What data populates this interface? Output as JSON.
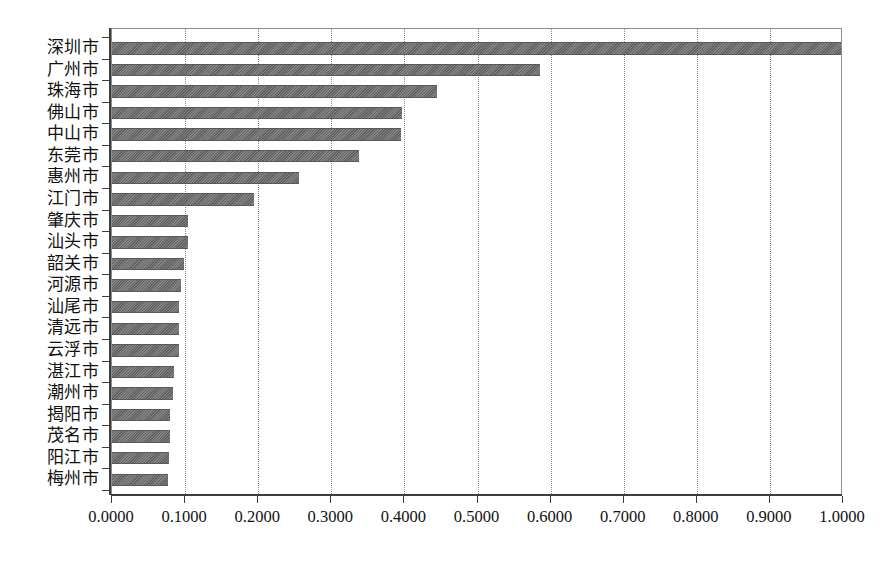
{
  "chart_data": {
    "type": "bar",
    "orientation": "horizontal",
    "title": "",
    "subtitle": "",
    "xlabel": "",
    "ylabel": "",
    "xlim": [
      0.0,
      1.0
    ],
    "grid": true,
    "legend": false,
    "legend_position": "none",
    "bar_color": "#6d6d6d",
    "axis_color": "#3d3d3d",
    "gridline_color": "#8a8a8a",
    "background_color": "#ffffff",
    "xticks": [
      0.0,
      0.1,
      0.2,
      0.3,
      0.4,
      0.5,
      0.6,
      0.7,
      0.8,
      0.9,
      1.0
    ],
    "xtick_labels": [
      "0.0000",
      "0.1000",
      "0.2000",
      "0.3000",
      "0.4000",
      "0.5000",
      "0.6000",
      "0.7000",
      "0.8000",
      "0.9000",
      "1.0000"
    ],
    "categories": [
      "深圳市",
      "广州市",
      "珠海市",
      "佛山市",
      "中山市",
      "东莞市",
      "惠州市",
      "江门市",
      "肇庆市",
      "汕头市",
      "韶关市",
      "河源市",
      "汕尾市",
      "清远市",
      "云浮市",
      "湛江市",
      "潮州市",
      "揭阳市",
      "茂名市",
      "阳江市",
      "梅州市"
    ],
    "values": [
      1.0,
      0.585,
      0.445,
      0.397,
      0.396,
      0.338,
      0.256,
      0.194,
      0.104,
      0.104,
      0.099,
      0.094,
      0.092,
      0.092,
      0.091,
      0.085,
      0.084,
      0.08,
      0.079,
      0.078,
      0.077
    ],
    "series": [
      {
        "name": "value",
        "values": [
          1.0,
          0.585,
          0.445,
          0.397,
          0.396,
          0.338,
          0.256,
          0.194,
          0.104,
          0.104,
          0.099,
          0.094,
          0.092,
          0.092,
          0.091,
          0.085,
          0.084,
          0.08,
          0.079,
          0.078,
          0.077
        ]
      }
    ]
  }
}
